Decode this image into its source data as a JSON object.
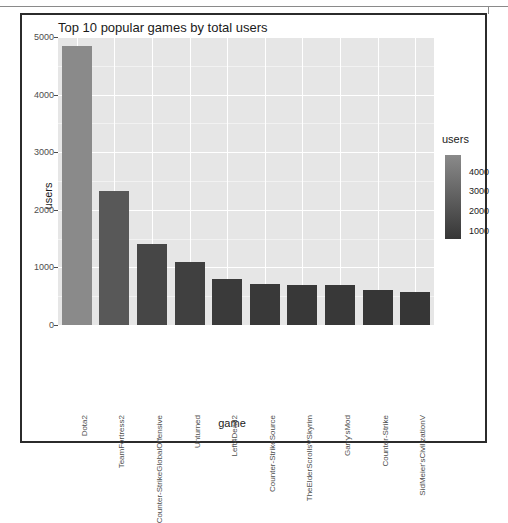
{
  "figure": {
    "title": "Top 10 popular games by total users",
    "xlabel": "game",
    "ylabel": "users",
    "legend_title": "users"
  },
  "axes": {
    "y_ticks": [
      "0",
      "1000",
      "2000",
      "3000",
      "4000",
      "5000"
    ],
    "colorbar_ticks": [
      "1000",
      "2000",
      "3000",
      "4000"
    ]
  },
  "colors": {
    "panel_background": "#e6e6e6",
    "gridline": "#ffffff",
    "bar_low": "#363636",
    "bar_high": "#8a8a8a",
    "frame": "#2b2b2b",
    "text": "#1a1a1a"
  },
  "chart_data": {
    "type": "bar",
    "title": "Top 10 popular games by total users",
    "xlabel": "game",
    "ylabel": "users",
    "categories": [
      "Dota2",
      "TeamFortress2",
      "Counter-StrikeGlobalOffensive",
      "Unturned",
      "Left4Dead2",
      "Counter-StrikeSource",
      "TheElderScrollsVSkyrim",
      "Garry'sMod",
      "Counter-Strike",
      "SidMeier'sCivilizationV"
    ],
    "values": [
      4850,
      2320,
      1400,
      1090,
      800,
      720,
      700,
      690,
      600,
      580
    ],
    "ylim": [
      0,
      5000
    ],
    "yticks": [
      0,
      1000,
      2000,
      3000,
      4000,
      5000
    ],
    "grid": true,
    "legend": {
      "type": "colorbar",
      "title": "users",
      "ticks": [
        1000,
        2000,
        3000,
        4000
      ],
      "range": [
        580,
        4850
      ],
      "low_color": "#363636",
      "high_color": "#8a8a8a",
      "position": "right"
    }
  }
}
